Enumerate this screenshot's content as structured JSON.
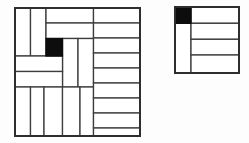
{
  "canvas": {
    "width": 249,
    "height": 143,
    "background": "#fdfdfd"
  },
  "style": {
    "line_color": "#3d3d3d",
    "outline_color": "#2e2e2e",
    "line_width": 1.3,
    "outline_width": 2,
    "black_fill": "#0d0d0d",
    "tile_fill": "#ffffff"
  },
  "figures": [
    {
      "id": "large-deficient-board",
      "kind": "tromino-tiling",
      "grid": {
        "rows": 8,
        "cols": 8
      },
      "black_cell_grid": {
        "row": 2,
        "col": 2
      },
      "box": {
        "x": 15,
        "y": 8,
        "w": 125,
        "h": 128
      },
      "black_cells": [
        {
          "x": 46,
          "y": 38.5,
          "w": 16.5,
          "h": 17.5
        }
      ],
      "tiles": [
        {
          "x": 15,
          "y": 8,
          "w": 15.5,
          "h": 48
        },
        {
          "x": 30.5,
          "y": 8,
          "w": 15.5,
          "h": 48
        },
        {
          "x": 46,
          "y": 8,
          "w": 47.5,
          "h": 15
        },
        {
          "x": 46,
          "y": 23,
          "w": 47.5,
          "h": 15.5
        },
        {
          "x": 62.5,
          "y": 38.5,
          "w": 15.5,
          "h": 48.5
        },
        {
          "x": 78,
          "y": 38.5,
          "w": 15.5,
          "h": 48.5
        },
        {
          "x": 15,
          "y": 56,
          "w": 47.5,
          "h": 15.5
        },
        {
          "x": 15,
          "y": 71.5,
          "w": 47.5,
          "h": 15.5
        },
        {
          "x": 15,
          "y": 87,
          "w": 15.5,
          "h": 49
        },
        {
          "x": 30.5,
          "y": 87,
          "w": 13.5,
          "h": 49
        },
        {
          "x": 44,
          "y": 87,
          "w": 18.5,
          "h": 49
        },
        {
          "x": 62.5,
          "y": 87,
          "w": 17.5,
          "h": 49
        },
        {
          "x": 80,
          "y": 87,
          "w": 13.5,
          "h": 49
        },
        {
          "x": 93.5,
          "y": 8,
          "w": 46.5,
          "h": 15
        },
        {
          "x": 93.5,
          "y": 23,
          "w": 46.5,
          "h": 15
        },
        {
          "x": 93.5,
          "y": 38,
          "w": 46.5,
          "h": 15
        },
        {
          "x": 93.5,
          "y": 53,
          "w": 46.5,
          "h": 15
        },
        {
          "x": 93.5,
          "y": 68,
          "w": 46.5,
          "h": 15
        },
        {
          "x": 93.5,
          "y": 83,
          "w": 46.5,
          "h": 15
        },
        {
          "x": 93.5,
          "y": 98,
          "w": 46.5,
          "h": 15
        },
        {
          "x": 93.5,
          "y": 113,
          "w": 46.5,
          "h": 15
        },
        {
          "x": 93.5,
          "y": 128,
          "w": 46.5,
          "h": 8
        }
      ]
    },
    {
      "id": "small-deficient-board",
      "kind": "tromino-tiling",
      "grid": {
        "rows": 4,
        "cols": 4
      },
      "black_cell_grid": {
        "row": 0,
        "col": 0
      },
      "box": {
        "x": 175,
        "y": 7,
        "w": 64,
        "h": 66
      },
      "black_cells": [
        {
          "x": 175,
          "y": 7,
          "w": 16,
          "h": 16.3
        }
      ],
      "tiles": [
        {
          "x": 175,
          "y": 23.3,
          "w": 16,
          "h": 49.7
        },
        {
          "x": 191,
          "y": 7,
          "w": 48,
          "h": 16.3
        },
        {
          "x": 191,
          "y": 23.3,
          "w": 48,
          "h": 16
        },
        {
          "x": 191,
          "y": 39.3,
          "w": 48,
          "h": 15.7
        },
        {
          "x": 191,
          "y": 55,
          "w": 48,
          "h": 18
        }
      ]
    }
  ]
}
